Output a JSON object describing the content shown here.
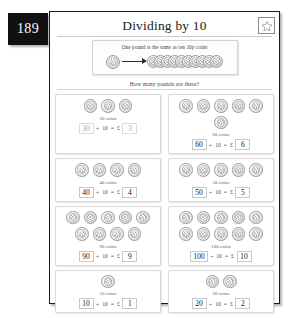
{
  "page": {
    "number": "189",
    "title": "Dividing by 10"
  },
  "sticker_box": {
    "icon": "star-icon"
  },
  "banner": {
    "text": "One pound is the same as ten 10p coins",
    "left_coin_label": "pound-coin",
    "arrow_label": "arrow-right-icon",
    "stack_count": 10
  },
  "prompt": "How many pounds are there?",
  "equation_symbols": {
    "divide": "÷",
    "equals": "=",
    "pound": "£"
  },
  "questions": [
    {
      "id": "q1",
      "coins": 3,
      "count_label": "30 coins",
      "dividend": "30",
      "divisor": "10",
      "answer": "3",
      "muted": true
    },
    {
      "id": "q2",
      "coins": 6,
      "count_label": "60 coins",
      "dividend": "60",
      "divisor": "10",
      "answer": "6",
      "muted": false
    },
    {
      "id": "q3",
      "coins": 4,
      "count_label": "40 coins",
      "dividend": "40",
      "divisor": "10",
      "answer": "4",
      "muted": false
    },
    {
      "id": "q4",
      "coins": 5,
      "count_label": "50 coins",
      "dividend": "50",
      "divisor": "10",
      "answer": "5",
      "muted": false
    },
    {
      "id": "q5",
      "coins": 9,
      "count_label": "90 coins",
      "dividend": "90",
      "divisor": "10",
      "answer": "9",
      "muted": false
    },
    {
      "id": "q6",
      "coins": 10,
      "count_label": "100 coins",
      "dividend": "100",
      "divisor": "10",
      "answer": "10",
      "muted": false
    },
    {
      "id": "q7",
      "coins": 1,
      "count_label": "10 coins",
      "dividend": "10",
      "divisor": "10",
      "answer": "1",
      "muted": false
    },
    {
      "id": "q8",
      "coins": 2,
      "count_label": "20 coins",
      "dividend": "20",
      "divisor": "10",
      "answer": "2",
      "muted": false
    }
  ],
  "colors": {
    "page_badge_bg": "#111111",
    "page_badge_text": "#ffffff",
    "border": "#1a1a1a",
    "box_border": "#dadada"
  }
}
